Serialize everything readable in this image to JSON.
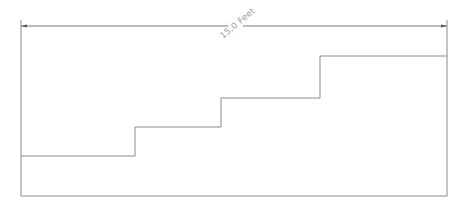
{
  "diagram": {
    "type": "stair-profile",
    "dimension": {
      "label": "15.0 Feet",
      "value": 15.0,
      "unit": "Feet",
      "rotation_deg": -40
    },
    "colors": {
      "line": "#8c8c8c",
      "dimension_line": "#7a7a7a",
      "label": "#9a9a9a",
      "background": "#ffffff"
    },
    "frame": {
      "left": 21,
      "right": 447,
      "top": 20,
      "bottom": 196
    },
    "dimension_line_y": 26,
    "steps": [
      {
        "x_start": 21,
        "x_end": 135,
        "y": 156
      },
      {
        "x_start": 135,
        "x_end": 221,
        "y": 127
      },
      {
        "x_start": 221,
        "x_end": 320,
        "y": 98
      },
      {
        "x_start": 320,
        "x_end": 447,
        "y": 56
      }
    ]
  }
}
